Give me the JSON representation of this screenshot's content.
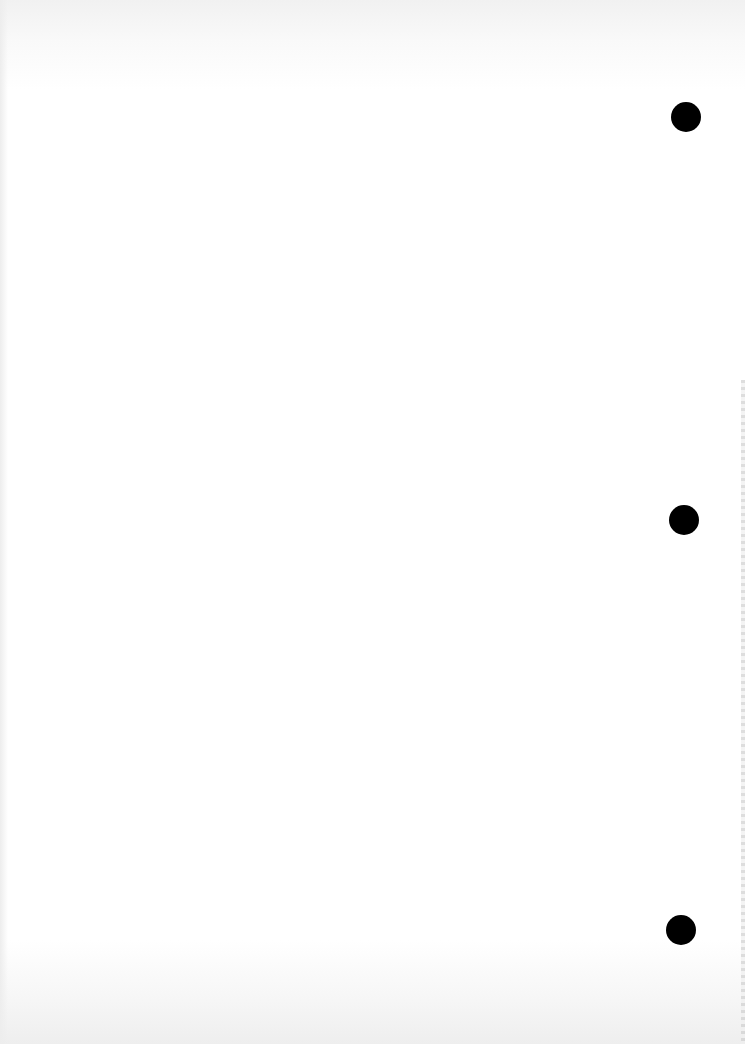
{
  "document": {
    "type": "blank scanned page",
    "text": "",
    "paper_color": "#ffffff",
    "punch_holes": [
      {
        "cx": 686,
        "cy": 117,
        "r": 15,
        "color": "#000000"
      },
      {
        "cx": 684,
        "cy": 520,
        "r": 15,
        "color": "#000000"
      },
      {
        "cx": 681,
        "cy": 930,
        "r": 15,
        "color": "#000000"
      }
    ]
  }
}
